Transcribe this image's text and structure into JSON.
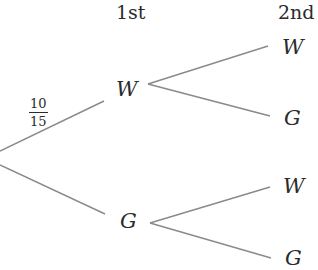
{
  "diagram": {
    "type": "probability-tree",
    "headers": {
      "first": "1st",
      "second": "2nd"
    },
    "root": {
      "x": 0,
      "y": 158
    },
    "level1": [
      {
        "label": "W",
        "probability": {
          "numerator": "10",
          "denominator": "15"
        }
      },
      {
        "label": "G",
        "probability": null
      }
    ],
    "level2": [
      {
        "parent": "W",
        "label": "W"
      },
      {
        "parent": "W",
        "label": "G"
      },
      {
        "parent": "G",
        "label": "W"
      },
      {
        "parent": "G",
        "label": "G"
      }
    ],
    "colors": {
      "line": "#8a8a8a",
      "text": "#2b2b2b",
      "background": "#ffffff"
    }
  }
}
